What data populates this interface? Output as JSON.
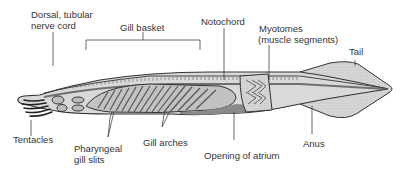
{
  "figure": {
    "colors": {
      "body_fill": "#d4d4d4",
      "body_dark": "#9a9a9a",
      "outline": "#333333",
      "label_text": "#333333",
      "leader_line": "#444444",
      "background": "#ffffff"
    }
  },
  "labels": {
    "nerve_cord_line1": "Dorsal, tubular",
    "nerve_cord_line2": "nerve cord",
    "gill_basket": "Gill basket",
    "notochord": "Notochord",
    "myotomes_line1": "Myotomes",
    "myotomes_line2": "(muscle segments)",
    "tail": "Tail",
    "tentacles": "Tentacles",
    "pharyngeal_line1": "Pharyngeal",
    "pharyngeal_line2": "gill slits",
    "gill_arches": "Gill arches",
    "opening_of_atrium": "Opening of atrium",
    "anus": "Anus"
  }
}
